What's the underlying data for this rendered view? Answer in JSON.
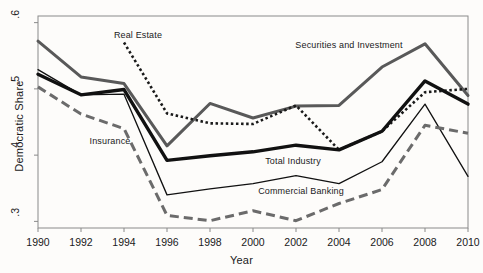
{
  "chart_data": {
    "type": "line",
    "title": "",
    "xlabel": "Year",
    "ylabel": "Democratic Share",
    "x": [
      1990,
      1992,
      1994,
      1996,
      1998,
      2000,
      2002,
      2004,
      2006,
      2008,
      2010
    ],
    "xlim": [
      1990,
      2010
    ],
    "ylim": [
      0.29,
      0.61
    ],
    "yticks": [
      0.3,
      0.4,
      0.5,
      0.6
    ],
    "ytick_labels": [
      ".3",
      ".4",
      ".5",
      ".6"
    ],
    "xticks": [
      1990,
      1992,
      1994,
      1996,
      1998,
      2000,
      2002,
      2004,
      2006,
      2008,
      2010
    ],
    "xtick_labels": [
      "1990",
      "1992",
      "1994",
      "1996",
      "1998",
      "2000",
      "2002",
      "2004",
      "2006",
      "2008",
      "2010"
    ],
    "grid": false,
    "legend": "inline-annotations",
    "series": [
      {
        "name": "Securities and Investment",
        "style": "solid-thick-gray",
        "color": "#595959",
        "values": [
          0.572,
          0.518,
          0.508,
          0.414,
          0.478,
          0.456,
          0.474,
          0.475,
          0.533,
          0.568,
          0.49
        ]
      },
      {
        "name": "Real Estate",
        "style": "dotted-black",
        "color": "#1a1a1a",
        "values": [
          null,
          null,
          0.57,
          0.463,
          0.448,
          0.447,
          0.475,
          0.408,
          0.436,
          0.495,
          0.5
        ]
      },
      {
        "name": "Total Industry",
        "style": "solid-thick-black",
        "color": "#111111",
        "values": [
          0.522,
          0.491,
          0.499,
          0.392,
          0.399,
          0.405,
          0.415,
          0.408,
          0.436,
          0.512,
          0.477
        ]
      },
      {
        "name": "Commercial Banking",
        "style": "solid-thin-black",
        "color": "#111111",
        "values": [
          0.529,
          0.491,
          0.492,
          0.34,
          0.349,
          0.357,
          0.369,
          0.357,
          0.39,
          0.477,
          0.368
        ]
      },
      {
        "name": "Insurance",
        "style": "dashed-gray",
        "color": "#6b6b6b",
        "values": [
          0.503,
          0.462,
          0.44,
          0.309,
          0.301,
          0.316,
          0.301,
          0.327,
          0.348,
          0.445,
          0.433
        ]
      }
    ],
    "annotations": [
      {
        "text": "Real Estate",
        "series": "Real Estate",
        "x_px": 138,
        "y_px": 30
      },
      {
        "text": "Securities and Investment",
        "series": "Securities and Investment",
        "x_px": 349,
        "y_px": 40
      },
      {
        "text": "Insurance",
        "series": "Insurance",
        "x_px": 110,
        "y_px": 136
      },
      {
        "text": "Total Industry",
        "series": "Total Industry",
        "x_px": 293,
        "y_px": 156
      },
      {
        "text": "Commercial Banking",
        "series": "Commercial Banking",
        "x_px": 301,
        "y_px": 186
      }
    ]
  },
  "axes": {
    "y_title": "Democratic Share",
    "x_title": "Year"
  }
}
